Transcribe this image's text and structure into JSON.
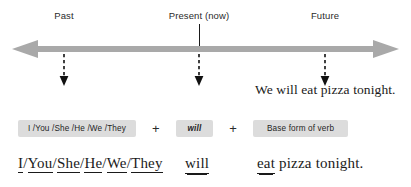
{
  "diagram": {
    "colors": {
      "timeline_arrow": "#a9a9a9",
      "chip_background": "#dcdcdc",
      "text": "#1a1a1a",
      "dashed_arrow": "#111111"
    }
  },
  "timeline": {
    "labels": {
      "past": "Past",
      "present": "Present (now)",
      "future": "Future"
    },
    "direction": "bidirectional"
  },
  "example": {
    "sentence": "We will eat pizza tonight."
  },
  "formula": {
    "subject_chip": "I /You /She /He /We /They",
    "plus_1": "+",
    "auxiliary_chip": "will",
    "plus_2": "+",
    "verb_chip": "Base form of verb"
  },
  "parsed_sentence": {
    "subjects": [
      "I",
      "You",
      "She",
      "He",
      "We",
      "They"
    ],
    "separator": "/",
    "auxiliary": "will",
    "verb": "eat",
    "complement": " pizza tonight."
  }
}
